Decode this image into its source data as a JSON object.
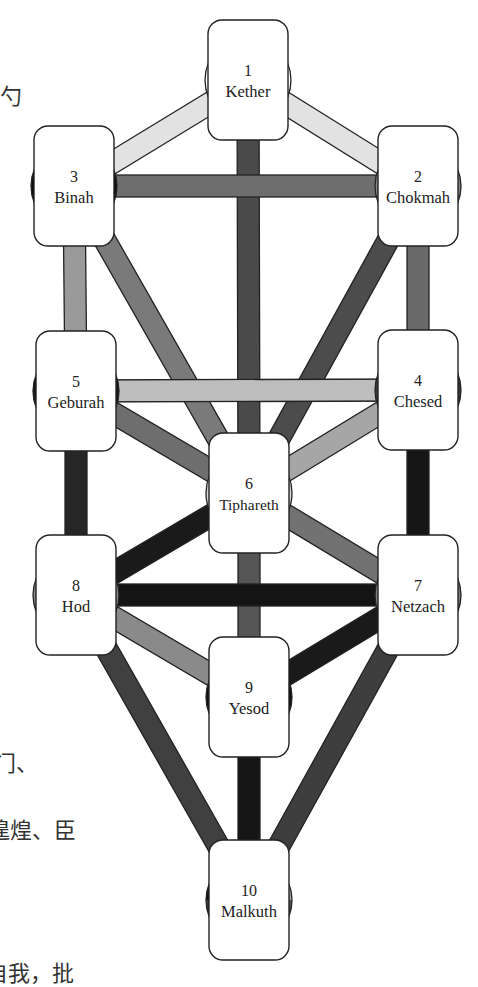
{
  "diagram": {
    "colors": {
      "outline": "#222222",
      "box_fill": "#ffffff",
      "path_light": "#e2e2e2",
      "path_mid_light": "#b4b4b4",
      "path_mid": "#8c8c8c",
      "path_dark": "#5a5a5a",
      "path_very_dark": "#1e1e1e"
    },
    "sephiroth": [
      {
        "number": "1",
        "name": "Kether",
        "cx": 248,
        "cy": 80,
        "disc": [
          "#ffffff"
        ]
      },
      {
        "number": "2",
        "name": "Chokmah",
        "cx": 418,
        "cy": 186,
        "disc": [
          "#8a8a8a"
        ]
      },
      {
        "number": "3",
        "name": "Binah",
        "cx": 74,
        "cy": 186,
        "disc": [
          "#0a0a0a"
        ]
      },
      {
        "number": "4",
        "name": "Chesed",
        "cx": 418,
        "cy": 390,
        "disc": [
          "#3a3a3a"
        ]
      },
      {
        "number": "5",
        "name": "Geburah",
        "cx": 76,
        "cy": 391,
        "disc": [
          "#141414"
        ]
      },
      {
        "number": "6",
        "name": "Tiphareth",
        "cx": 249,
        "cy": 493,
        "disc": [
          "#d8d8d8"
        ]
      },
      {
        "number": "7",
        "name": "Netzach",
        "cx": 418,
        "cy": 595,
        "disc": [
          "#808080"
        ]
      },
      {
        "number": "8",
        "name": "Hod",
        "cx": 76,
        "cy": 595,
        "disc": [
          "#8a8a8a"
        ]
      },
      {
        "number": "9",
        "name": "Yesod",
        "cx": 249,
        "cy": 697,
        "disc": [
          "#111111"
        ]
      },
      {
        "number": "10",
        "name": "Malkuth",
        "cx": 249,
        "cy": 900,
        "disc": [
          "#111111",
          "#a8a8a8",
          "#555555",
          "#3c3c3c"
        ]
      }
    ],
    "paths": [
      {
        "from": "1",
        "to": "2",
        "color": "#e2e2e2"
      },
      {
        "from": "1",
        "to": "3",
        "color": "#e2e2e2"
      },
      {
        "from": "1",
        "to": "6",
        "color": "#4a4a4a"
      },
      {
        "from": "2",
        "to": "3",
        "color": "#6e6e6e"
      },
      {
        "from": "2",
        "to": "4",
        "color": "#6a6a6a"
      },
      {
        "from": "2",
        "to": "6",
        "color": "#4c4c4c"
      },
      {
        "from": "3",
        "to": "5",
        "color": "#9a9a9a"
      },
      {
        "from": "3",
        "to": "6",
        "color": "#7a7a7a"
      },
      {
        "from": "4",
        "to": "5",
        "color": "#bdbdbd"
      },
      {
        "from": "4",
        "to": "6",
        "color": "#a6a6a6"
      },
      {
        "from": "4",
        "to": "7",
        "color": "#161616"
      },
      {
        "from": "5",
        "to": "6",
        "color": "#6e6e6e"
      },
      {
        "from": "5",
        "to": "8",
        "color": "#262626"
      },
      {
        "from": "6",
        "to": "7",
        "color": "#727272"
      },
      {
        "from": "6",
        "to": "8",
        "color": "#1a1a1a"
      },
      {
        "from": "6",
        "to": "9",
        "color": "#565656"
      },
      {
        "from": "7",
        "to": "8",
        "color": "#141414"
      },
      {
        "from": "7",
        "to": "9",
        "color": "#1a1a1a"
      },
      {
        "from": "7",
        "to": "10",
        "color": "#3e3e3e"
      },
      {
        "from": "8",
        "to": "9",
        "color": "#8a8a8a"
      },
      {
        "from": "8",
        "to": "10",
        "color": "#404040"
      },
      {
        "from": "9",
        "to": "10",
        "color": "#161616"
      }
    ]
  },
  "margin_text": [
    {
      "text": "勺",
      "x": 0,
      "y": 78
    },
    {
      "text": "门、",
      "x": -6,
      "y": 745
    },
    {
      "text": "遑煌、臣",
      "x": -12,
      "y": 812
    },
    {
      "text": "自我，批",
      "x": -14,
      "y": 955
    }
  ]
}
